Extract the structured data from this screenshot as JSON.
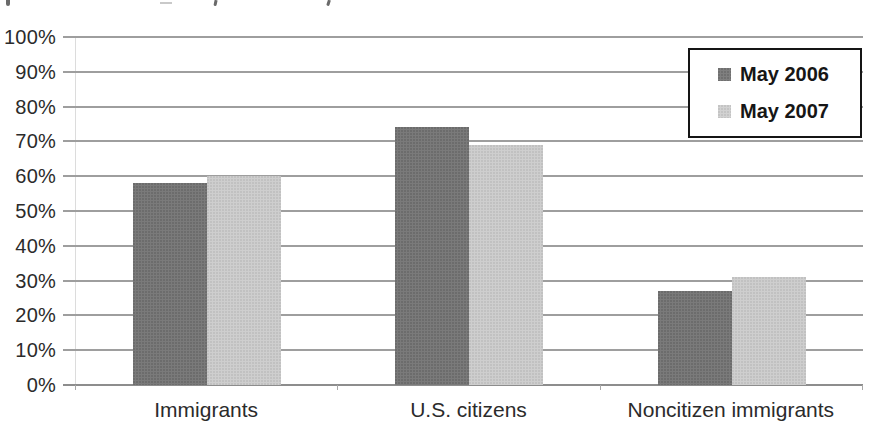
{
  "chart_data": {
    "type": "bar",
    "title": "",
    "categories": [
      "Immigrants",
      "U.S. citizens",
      "Noncitizen immigrants"
    ],
    "series": [
      {
        "name": "May 2006",
        "values": [
          58,
          74,
          27
        ],
        "color": "#7a7a7a"
      },
      {
        "name": "May 2007",
        "values": [
          60,
          69,
          31
        ],
        "color": "#cecece"
      }
    ],
    "xlabel": "",
    "ylabel": "",
    "y_axis": {
      "min": 0,
      "max": 100,
      "step": 10,
      "tick_labels": [
        "100%",
        "90%",
        "80%",
        "70%",
        "60%",
        "50%",
        "40%",
        "30%",
        "20%",
        "10%",
        "0%"
      ]
    },
    "grid": true,
    "legend_position": "top-right",
    "colors": {
      "gridline": "#9e9e9e",
      "axis_line": "#8d8d8d",
      "text": "#2b2b2b",
      "legend_border": "#151515",
      "background": "#ffffff"
    }
  }
}
